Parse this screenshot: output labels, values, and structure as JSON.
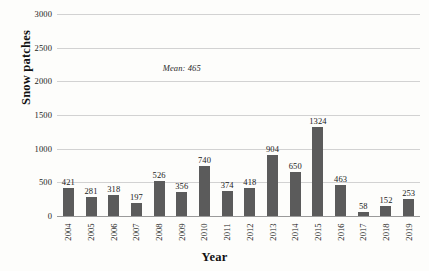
{
  "chart_data": {
    "type": "bar",
    "title": "",
    "xlabel": "Year",
    "ylabel": "Snow patches",
    "categories": [
      "2004",
      "2005",
      "2006",
      "2007",
      "2008",
      "2009",
      "2010",
      "2011",
      "2012",
      "2013",
      "2014",
      "2015",
      "2016",
      "2017",
      "2018",
      "2019"
    ],
    "values": [
      421,
      281,
      318,
      197,
      526,
      356,
      740,
      374,
      418,
      904,
      650,
      1324,
      463,
      58,
      152,
      253
    ],
    "data_labels": [
      "421",
      "281",
      "318",
      "197",
      "526",
      "356",
      "740",
      "374",
      "418",
      "904",
      "650",
      "1324",
      "463",
      "58",
      "152",
      "253"
    ],
    "ylim": [
      0,
      3000
    ],
    "yticks": [
      0,
      500,
      1000,
      1500,
      2000,
      2500,
      3000
    ],
    "ytick_labels": [
      "0",
      "500",
      "1000",
      "1500",
      "2000",
      "2500",
      "3000"
    ],
    "grid": true,
    "legend": false,
    "annotations": [
      {
        "text": "Mean: 465",
        "x_value": 2009.0,
        "y_value": 2200
      }
    ],
    "bar_color": "#5b5b5b",
    "gridline_color": "#d2d2d2",
    "axis_color": "#9a9a9a",
    "background_color": "#fdfdfb"
  }
}
